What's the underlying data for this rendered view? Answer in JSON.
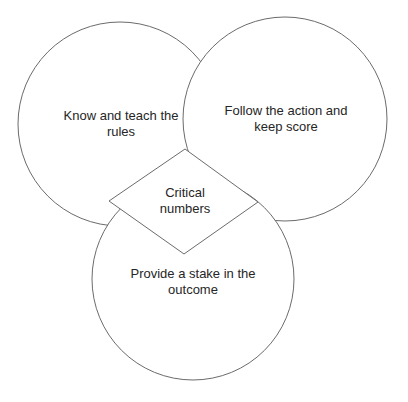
{
  "diagram": {
    "stroke_color": "#6b6b6b",
    "fill_color": "#ffffff",
    "text_color": "#262626",
    "circles": [
      {
        "id": "left",
        "label": "Know and teach the rules",
        "cx": 120,
        "cy": 124,
        "r": 102
      },
      {
        "id": "right",
        "label": "Follow the action and keep score",
        "cx": 285,
        "cy": 119,
        "r": 102
      },
      {
        "id": "bottom",
        "label": "Provide a stake in the outcome",
        "cx": 193,
        "cy": 279,
        "r": 101
      }
    ],
    "center": {
      "id": "diamond",
      "label": "Critical numbers",
      "points": [
        [
          185,
          149
        ],
        [
          258,
          202
        ],
        [
          184,
          254
        ],
        [
          109,
          201
        ]
      ]
    }
  }
}
